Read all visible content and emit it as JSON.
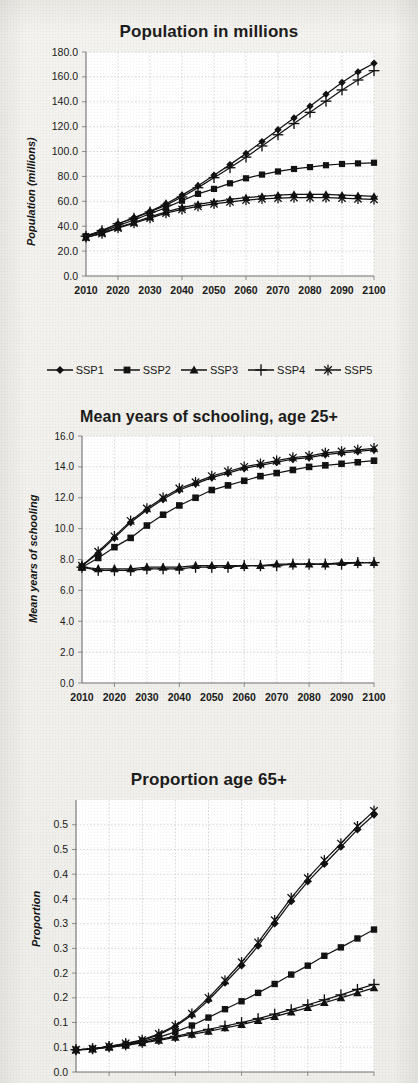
{
  "page": {
    "background_color": "#f1f0ec",
    "ink_color": "#111111",
    "panel_background": "#ffffff",
    "gridline_color": "#c9c9c9"
  },
  "legend": {
    "items": [
      {
        "label": "SSP1",
        "marker": "diamond-marker"
      },
      {
        "label": "SSP2",
        "marker": "square-marker"
      },
      {
        "label": "SSP3",
        "marker": "triangle-marker"
      },
      {
        "label": "SSP4",
        "marker": "plus-marker"
      },
      {
        "label": "SSP5",
        "marker": "asterisk-marker"
      }
    ]
  },
  "chart_data": [
    {
      "type": "line",
      "title": "Population in millions",
      "xlabel": "",
      "ylabel": "Population (millions)",
      "xlim": [
        2010,
        2100
      ],
      "ylim": [
        0,
        180
      ],
      "ytick_step": 20,
      "grid": true,
      "legend_position": "bottom",
      "x": [
        2010,
        2015,
        2020,
        2025,
        2030,
        2035,
        2040,
        2045,
        2050,
        2055,
        2060,
        2065,
        2070,
        2075,
        2080,
        2085,
        2090,
        2095,
        2100
      ],
      "ytick_labels": [
        "0.0",
        "20.0",
        "40.0",
        "60.0",
        "80.0",
        "100.0",
        "120.0",
        "140.0",
        "160.0",
        "180.0"
      ],
      "xtick_labels": [
        "2010",
        "2020",
        "2030",
        "2040",
        "2050",
        "2060",
        "2070",
        "2080",
        "2090",
        "2100"
      ],
      "series": [
        {
          "name": "SSP1",
          "marker": "diamond-marker",
          "values": [
            32.0,
            36.5,
            42.0,
            47.0,
            52.0,
            58.0,
            65.0,
            72.5,
            81.0,
            89.5,
            98.5,
            108.0,
            117.5,
            127.0,
            136.5,
            146.0,
            155.5,
            164.0,
            171.0
          ]
        },
        {
          "name": "SSP2",
          "marker": "square-marker",
          "values": [
            32.0,
            35.5,
            40.5,
            45.0,
            50.0,
            55.0,
            60.5,
            66.0,
            70.0,
            74.5,
            78.5,
            81.5,
            84.0,
            86.0,
            87.5,
            89.0,
            90.0,
            90.5,
            91.0
          ]
        },
        {
          "name": "SSP3",
          "marker": "triangle-marker",
          "values": [
            31.0,
            34.5,
            39.0,
            43.0,
            47.5,
            51.5,
            55.0,
            57.5,
            59.5,
            61.5,
            63.0,
            64.0,
            65.0,
            65.5,
            65.5,
            65.5,
            65.0,
            64.5,
            64.0
          ]
        },
        {
          "name": "SSP4",
          "marker": "plus-marker",
          "values": [
            32.0,
            36.5,
            42.0,
            46.5,
            51.5,
            57.0,
            63.5,
            71.0,
            79.0,
            87.0,
            95.5,
            104.5,
            113.5,
            122.5,
            131.5,
            140.5,
            149.5,
            157.5,
            165.0
          ]
        },
        {
          "name": "SSP5",
          "marker": "asterisk-marker",
          "values": [
            31.0,
            34.0,
            38.5,
            42.5,
            46.5,
            50.5,
            53.5,
            56.0,
            58.0,
            59.5,
            61.0,
            62.0,
            62.5,
            63.0,
            63.0,
            63.0,
            62.5,
            62.0,
            61.5
          ]
        }
      ]
    },
    {
      "type": "line",
      "title": "Mean years of schooling, age 25+",
      "xlabel": "",
      "ylabel": "Mean years of schooling",
      "xlim": [
        2010,
        2100
      ],
      "ylim": [
        0,
        16
      ],
      "ytick_step": 2,
      "grid": true,
      "legend_position": "none",
      "x": [
        2010,
        2015,
        2020,
        2025,
        2030,
        2035,
        2040,
        2045,
        2050,
        2055,
        2060,
        2065,
        2070,
        2075,
        2080,
        2085,
        2090,
        2095,
        2100
      ],
      "ytick_labels": [
        "0.0",
        "2.0",
        "4.0",
        "6.0",
        "8.0",
        "10.0",
        "12.0",
        "14.0",
        "16.0"
      ],
      "xtick_labels": [
        "2010",
        "2020",
        "2030",
        "2040",
        "2050",
        "2060",
        "2070",
        "2080",
        "2090",
        "2100"
      ],
      "series": [
        {
          "name": "SSP1",
          "marker": "diamond-marker",
          "values": [
            7.6,
            8.4,
            9.4,
            10.4,
            11.2,
            11.9,
            12.5,
            12.9,
            13.3,
            13.6,
            13.9,
            14.1,
            14.3,
            14.5,
            14.6,
            14.8,
            14.9,
            15.0,
            15.1
          ]
        },
        {
          "name": "SSP2",
          "marker": "square-marker",
          "values": [
            7.5,
            8.1,
            8.8,
            9.4,
            10.2,
            10.9,
            11.5,
            12.0,
            12.5,
            12.8,
            13.1,
            13.4,
            13.6,
            13.8,
            14.0,
            14.1,
            14.2,
            14.3,
            14.4
          ]
        },
        {
          "name": "SSP3",
          "marker": "triangle-marker",
          "values": [
            7.5,
            7.4,
            7.4,
            7.4,
            7.5,
            7.5,
            7.5,
            7.6,
            7.6,
            7.6,
            7.6,
            7.6,
            7.7,
            7.7,
            7.7,
            7.7,
            7.8,
            7.8,
            7.8
          ]
        },
        {
          "name": "SSP4",
          "marker": "plus-marker",
          "values": [
            7.5,
            7.3,
            7.3,
            7.3,
            7.4,
            7.4,
            7.4,
            7.5,
            7.5,
            7.5,
            7.6,
            7.6,
            7.6,
            7.7,
            7.7,
            7.7,
            7.7,
            7.8,
            7.8
          ]
        },
        {
          "name": "SSP5",
          "marker": "asterisk-marker",
          "values": [
            7.6,
            8.5,
            9.5,
            10.5,
            11.3,
            12.0,
            12.6,
            13.0,
            13.4,
            13.7,
            14.0,
            14.2,
            14.4,
            14.6,
            14.7,
            14.9,
            15.0,
            15.1,
            15.2
          ]
        }
      ]
    },
    {
      "type": "line",
      "title": "Proportion age 65+",
      "xlabel": "",
      "ylabel": "Proportion",
      "xlim": [
        2010,
        2100
      ],
      "ylim": [
        0,
        0.55
      ],
      "ytick_step": 0.05,
      "grid": true,
      "legend_position": "none",
      "note": "bottom of panel is cropped by the page edge",
      "x": [
        2010,
        2015,
        2020,
        2025,
        2030,
        2035,
        2040,
        2045,
        2050,
        2055,
        2060,
        2065,
        2070,
        2075,
        2080,
        2085,
        2090,
        2095,
        2100
      ],
      "ytick_labels": [
        "0.0",
        "0.1",
        "0.1",
        "0.2",
        "0.2",
        "0.3",
        "0.3",
        "0.4",
        "0.4",
        "0.5",
        "0.5"
      ],
      "ytick_values": [
        0.0,
        0.05,
        0.1,
        0.15,
        0.2,
        0.25,
        0.3,
        0.35,
        0.4,
        0.45,
        0.5
      ],
      "xtick_labels": [
        "2010",
        "2020",
        "2030",
        "2040",
        "2050",
        "2060",
        "2070",
        "2080",
        "2090",
        "2100"
      ],
      "series": [
        {
          "name": "SSP1",
          "marker": "diamond-marker",
          "values": [
            0.045,
            0.047,
            0.052,
            0.057,
            0.064,
            0.075,
            0.092,
            0.115,
            0.145,
            0.18,
            0.215,
            0.255,
            0.3,
            0.345,
            0.385,
            0.42,
            0.455,
            0.49,
            0.52
          ]
        },
        {
          "name": "SSP2",
          "marker": "square-marker",
          "values": [
            0.045,
            0.047,
            0.051,
            0.056,
            0.062,
            0.07,
            0.081,
            0.094,
            0.11,
            0.127,
            0.143,
            0.16,
            0.178,
            0.197,
            0.215,
            0.235,
            0.252,
            0.27,
            0.288
          ]
        },
        {
          "name": "SSP3",
          "marker": "triangle-marker",
          "values": [
            0.044,
            0.046,
            0.05,
            0.054,
            0.059,
            0.064,
            0.07,
            0.076,
            0.082,
            0.089,
            0.096,
            0.104,
            0.112,
            0.121,
            0.13,
            0.14,
            0.15,
            0.16,
            0.17
          ]
        },
        {
          "name": "SSP4",
          "marker": "plus-marker",
          "values": [
            0.045,
            0.047,
            0.051,
            0.055,
            0.06,
            0.066,
            0.072,
            0.079,
            0.086,
            0.093,
            0.1,
            0.108,
            0.117,
            0.126,
            0.136,
            0.146,
            0.156,
            0.167,
            0.177
          ]
        },
        {
          "name": "SSP5",
          "marker": "asterisk-marker",
          "values": [
            0.045,
            0.047,
            0.052,
            0.058,
            0.065,
            0.077,
            0.094,
            0.118,
            0.15,
            0.185,
            0.222,
            0.262,
            0.307,
            0.352,
            0.392,
            0.428,
            0.462,
            0.497,
            0.528
          ]
        }
      ]
    }
  ]
}
